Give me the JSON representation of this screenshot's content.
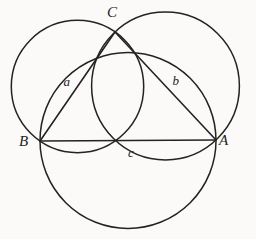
{
  "figure": {
    "background_color": "#fbfaf8",
    "stroke_color": "#232323",
    "stroke_width": 1.5,
    "width": 256,
    "height": 239,
    "vertices": [
      {
        "id": "A",
        "label": "A",
        "x": 216,
        "y": 140
      },
      {
        "id": "B",
        "label": "B",
        "x": 40,
        "y": 141
      },
      {
        "id": "C",
        "label": "C",
        "x": 115,
        "y": 32
      }
    ],
    "sides": [
      {
        "id": "a",
        "label": "a",
        "from": "B",
        "to": "C",
        "label_x": 67,
        "label_y": 81
      },
      {
        "id": "b",
        "label": "b",
        "from": "C",
        "to": "A",
        "label_x": 176,
        "label_y": 80
      },
      {
        "id": "c",
        "label": "c",
        "from": "B",
        "to": "A",
        "label_x": 131,
        "label_y": 152
      }
    ],
    "circles": [
      {
        "id": "circle-a",
        "diameter_side": "a",
        "cx": 77.5,
        "cy": 86.5,
        "r": 66.2
      },
      {
        "id": "circle-b",
        "diameter_side": "b",
        "cx": 165.5,
        "cy": 86.0,
        "r": 73.9
      },
      {
        "id": "circle-c",
        "diameter_side": "c",
        "cx": 128.0,
        "cy": 140.5,
        "r": 88.0
      }
    ]
  },
  "chart_data": {
    "type": "diagram",
    "points": {
      "A": [
        216,
        140
      ],
      "B": [
        40,
        141
      ],
      "C": [
        115,
        32
      ]
    },
    "segments": [
      {
        "name": "a",
        "endpoints": [
          "B",
          "C"
        ]
      },
      {
        "name": "b",
        "endpoints": [
          "C",
          "A"
        ]
      },
      {
        "name": "c",
        "endpoints": [
          "B",
          "A"
        ]
      }
    ],
    "circles": [
      {
        "name": "circle on a",
        "center": [
          77.5,
          86.5
        ],
        "radius": 66.2
      },
      {
        "name": "circle on b",
        "center": [
          165.5,
          86.0
        ],
        "radius": 73.9
      },
      {
        "name": "circle on c",
        "center": [
          128.0,
          140.5
        ],
        "radius": 88.0
      }
    ],
    "labels": [
      "A",
      "B",
      "C",
      "a",
      "b",
      "c"
    ]
  }
}
